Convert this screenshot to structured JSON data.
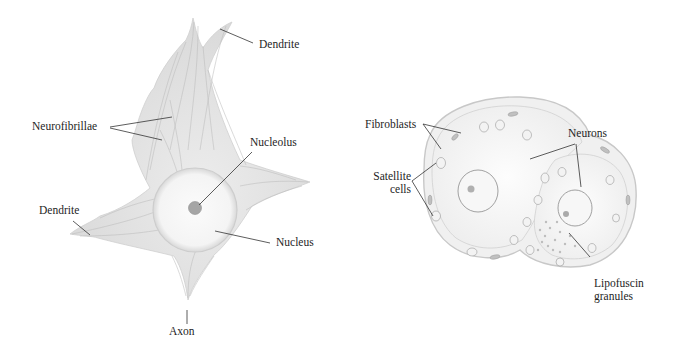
{
  "figure_left": {
    "title": "Neuron (cell body)",
    "labels": {
      "dendrite_top": "Dendrite",
      "neurofibrillae": "Neurofibrillae",
      "nucleolus": "Nucleolus",
      "dendrite_left": "Dendrite",
      "nucleus": "Nucleus",
      "axon": "Axon"
    }
  },
  "figure_right": {
    "title": "Ganglion neurons with satellite cells",
    "labels": {
      "fibroblasts": "Fibroblasts",
      "neurons": "Neurons",
      "satellite_line1": "Satellite",
      "satellite_line2": "cells",
      "lipofuscin_line1": "Lipofuscin",
      "lipofuscin_line2": "granules"
    }
  },
  "colors": {
    "text": "#1e1e1e",
    "leader": "#333333",
    "cytoplasm": "#dcdcdc",
    "fibril": "#b8b8b8",
    "nucleolus": "#9a9a9a"
  }
}
